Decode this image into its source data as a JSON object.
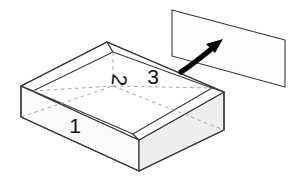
{
  "diagram": {
    "type": "isometric-open-box-with-lid",
    "background_color": "#ffffff",
    "stroke_color": "#3a3a3a",
    "hidden_edge_color": "#9a9a9a",
    "arrow_color": "#000000",
    "label_color": "#111111",
    "faces": {
      "front_left": {
        "label": "1",
        "fill": "#fbfbfb"
      },
      "interior_bottom": {
        "label": "2",
        "fill": "#ffffff"
      },
      "rim_top": {
        "label": "3",
        "fill": "#ffffff"
      },
      "front_right": {
        "fill": "#eeeeee"
      },
      "lid_panel": {
        "fill": "#fdfdfd"
      }
    },
    "labels": [
      {
        "text": "1",
        "x": 75,
        "y": 133,
        "rotation": 0,
        "name": "face-label-1"
      },
      {
        "text": "2",
        "x": 118,
        "y": 86,
        "rotation": 96,
        "name": "face-label-2"
      },
      {
        "text": "3",
        "x": 153,
        "y": 84,
        "rotation": 0,
        "name": "face-label-3"
      }
    ],
    "arrow": {
      "name": "lift-arrow",
      "direction": "up-right",
      "start": [
        181,
        72
      ],
      "end": [
        222,
        41
      ]
    },
    "box_geometry": {
      "rim_back_corner": [
        107,
        42
      ],
      "rim_left_corner": [
        21,
        86
      ],
      "rim_right_corner": [
        224,
        92
      ],
      "rim_front_corner": [
        139,
        140
      ],
      "base_left_corner": [
        21,
        117
      ],
      "base_front_corner": [
        139,
        171
      ],
      "base_right_corner": [
        224,
        130
      ]
    },
    "lid_geometry": {
      "top_left": [
        172,
        10
      ],
      "top_right": [
        285,
        40
      ],
      "bottom_right": [
        285,
        87
      ],
      "bottom_left": [
        172,
        56
      ]
    }
  }
}
